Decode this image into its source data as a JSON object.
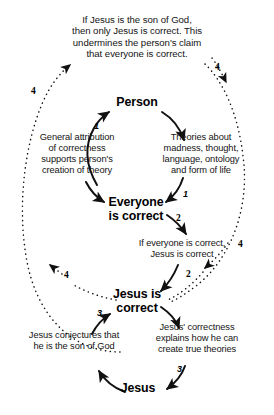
{
  "diagram": {
    "title_caption": "If Jesus is the son of God,\nthen only Jesus is correct. This\nundermines the person's claim\nthat everyone is correct.",
    "nodes": [
      {
        "id": "person",
        "label": "Person"
      },
      {
        "id": "everyone-is-correct",
        "label": "Everyone\nis correct"
      },
      {
        "id": "jesus-is-correct",
        "label": "Jesus is\ncorrect"
      },
      {
        "id": "jesus",
        "label": "Jesus"
      }
    ],
    "edge_texts": [
      {
        "id": "general-attribution",
        "text": "General attribution\nof correctness\nsupports person's\ncreation of theory"
      },
      {
        "id": "theories-about",
        "text": "Theories about\nmadness, thought,\nlanguage, ontology\nand form of life"
      },
      {
        "id": "if-everyone-correct",
        "text": "If everyone is correct,\nJesus is correct"
      },
      {
        "id": "jesus-correctness-explains",
        "text": "Jesus' correctness\nexplains how he can\ncreate true theories"
      },
      {
        "id": "jesus-conjectures",
        "text": "Jesus conjectures that\nhe is the son of God"
      }
    ],
    "cycle_labels": [
      {
        "id": "cycle-1-left",
        "value": "1"
      },
      {
        "id": "cycle-1-right",
        "value": "1"
      },
      {
        "id": "cycle-2-top",
        "value": "2"
      },
      {
        "id": "cycle-2-bottom",
        "value": "2"
      },
      {
        "id": "cycle-3-left",
        "value": "3"
      },
      {
        "id": "cycle-3-right",
        "value": "3"
      },
      {
        "id": "cycle-4-top-left",
        "value": "4"
      },
      {
        "id": "cycle-4-top-right",
        "value": "4"
      },
      {
        "id": "cycle-4-bottom-left",
        "value": "4"
      },
      {
        "id": "cycle-4-right",
        "value": "4"
      }
    ],
    "colors": {
      "ink": "#141414",
      "node_ink": "#000000",
      "background": "#ffffff"
    }
  }
}
